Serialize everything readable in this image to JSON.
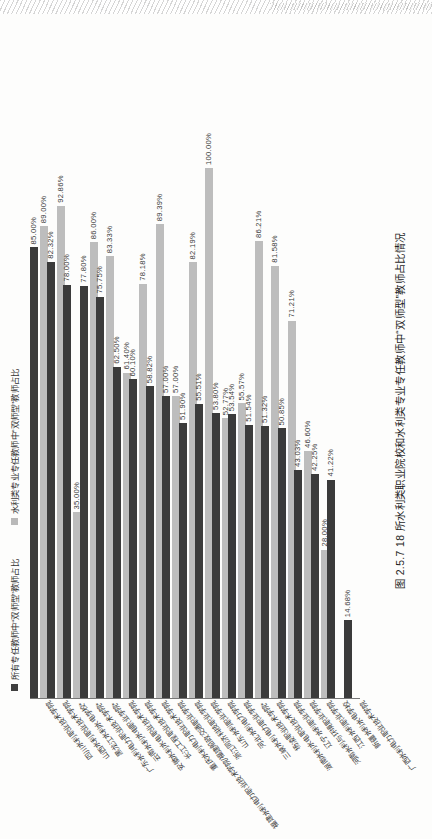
{
  "figure": {
    "caption": "图 2.5.7   18 所水利类职业院校和水利类专业专任教师中“双师型”教师占比情况"
  },
  "chart_data": {
    "type": "bar",
    "orientation": "horizontal",
    "title": "18 所水利类职业院校和水利类专业专任教师中“双师型”教师占比情况",
    "xlabel": "",
    "ylabel": "",
    "xlim": [
      0,
      100
    ],
    "grid": false,
    "legend_position": "top-left",
    "value_suffix": "%",
    "series": [
      {
        "name": "所有专任教师中“双师型”教师占比",
        "color": "#3b3b3b",
        "values": [
          85.0,
          82.32,
          78.0,
          78.0,
          77.8,
          75.75,
          62.5,
          60.1,
          58.82,
          57.0,
          51.9,
          55.51,
          53.8,
          53.54,
          51.54,
          51.32,
          50.85,
          43.03,
          42.25,
          41.22,
          14.68
        ],
        "labels": [
          "85.00%",
          "82.32%",
          "78.00%",
          "78.00%",
          "77.80%",
          "75.75%",
          "62.50%",
          "60.10%",
          "58.82%",
          "57.00%",
          "51.90%",
          "55.51%",
          "53.80%",
          "53.54%",
          "51.54%",
          "51.32%",
          "50.85%",
          "43.03%",
          "42.25%",
          "41.22%",
          "14.68%"
        ]
      },
      {
        "name": "水利类专业专任教师中“双师型”教师占比",
        "color": "#bdbdbd",
        "values": [
          89.0,
          92.86,
          35.0,
          86.0,
          83.33,
          61.4,
          78.18,
          89.39,
          57.0,
          82.19,
          100.0,
          52.77,
          55.57,
          86.21,
          81.58,
          71.21,
          46.6,
          28.0
        ],
        "labels": [
          "89.00%",
          "92.86%",
          "35.00%",
          "86.00%",
          "83.33%",
          "61.40%",
          "78.18%",
          "89.39%",
          "57.00%",
          "82.19%",
          "100.00%",
          "52.77%",
          "55.57%",
          "86.21%",
          "81.58%",
          "71.21%",
          "46.60%",
          "28.00%"
        ]
      }
    ],
    "bars": [
      {
        "category": "四川水利职业技术学院",
        "dark": 85.0,
        "dark_label": "85.00%",
        "light": 89.0,
        "light_label": "89.00%"
      },
      {
        "category": "山西水利职业技术学院",
        "dark": 82.32,
        "dark_label": "82.32%",
        "light": 92.86,
        "light_label": "92.86%"
      },
      {
        "category": "黑龙江水利水电学校*",
        "dark": 78.0,
        "dark_label": "78.00%",
        "light": 35.0,
        "light_label": "35.00%"
      },
      {
        "category": "广东水利电力职业技术学院*",
        "dark": 77.8,
        "dark_label": "77.80%",
        "light": 86.0,
        "light_label": "86.00%"
      },
      {
        "category": "云南水利水电职业学院*",
        "dark": 75.75,
        "dark_label": "75.75%",
        "light": 83.33,
        "light_label": "83.33%"
      },
      {
        "category": "安徽水利水电职业技术学院",
        "dark": 62.5,
        "dark_label": "62.50%",
        "light": 61.4,
        "light_label": "61.40%"
      },
      {
        "category": "长江工程职业技术学院",
        "dark": 60.1,
        "dark_label": "60.10%",
        "light": 78.18,
        "light_label": "78.18%"
      },
      {
        "category": "重庆水利电力职业技术学院",
        "dark": 58.82,
        "dark_label": "58.82%",
        "light": 89.39,
        "light_label": "89.39%"
      },
      {
        "category": "福建水利电力职业技术学院/福建船政交通职业学院",
        "dark": 57.0,
        "dark_label": "57.00%",
        "light": 57.0,
        "light_label": "57.00%"
      },
      {
        "category": "浙江同济科技职业学院",
        "dark": 51.9,
        "dark_label": "51.90%",
        "light": 82.19,
        "light_label": "82.19%"
      },
      {
        "category": "山东水利职业学院",
        "dark": 55.51,
        "dark_label": "55.51%",
        "light": 100.0,
        "light_label": "100.00%"
      },
      {
        "category": "河北水利电力学院",
        "dark": 53.8,
        "dark_label": "53.80%",
        "light": 52.77,
        "light_label": "52.77%"
      },
      {
        "category": "三峡水利电力职业学院",
        "dark": 53.54,
        "dark_label": "53.54%",
        "light": 55.57,
        "light_label": "55.57%"
      },
      {
        "category": "杨凌职业技术学院*",
        "dark": 51.54,
        "dark_label": "51.54%",
        "light": 86.21,
        "light_label": "86.21%"
      },
      {
        "category": "湖南水利水电职业技术学院",
        "dark": 51.32,
        "dark_label": "51.32%",
        "light": 81.58,
        "light_label": "81.58%"
      },
      {
        "category": "辽宁水利职业学院",
        "dark": 50.85,
        "dark_label": "50.85%",
        "light": 71.21,
        "light_label": "71.21%"
      },
      {
        "category": "河南水利与环境职业学院",
        "dark": 43.03,
        "dark_label": "43.03%",
        "light": 46.6,
        "light_label": "46.60%"
      },
      {
        "category": "江西水利职业学院",
        "dark": 42.25,
        "dark_label": "42.25%",
        "light": 28.0,
        "light_label": "28.00%"
      },
      {
        "category": "新疆水利水电学校",
        "dark": 41.22,
        "dark_label": "41.22%",
        "light": 0,
        "light_label": ""
      },
      {
        "category": "广西水利电力职业技术学院",
        "dark": 14.68,
        "dark_label": "14.68%",
        "light": 0,
        "light_label": ""
      }
    ]
  },
  "legend": {
    "items": [
      {
        "label": "所有专任教师中“双师型”教师占比",
        "color": "#3b3b3b"
      },
      {
        "label": "水利类专业专任教师中“双师型”教师占比",
        "color": "#bdbdbd"
      }
    ]
  }
}
